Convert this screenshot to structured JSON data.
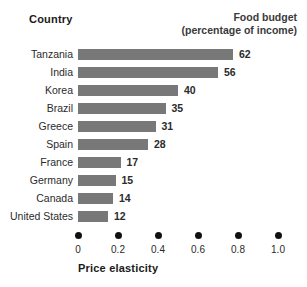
{
  "header": {
    "country_label": "Country",
    "food_budget_line1": "Food budget",
    "food_budget_line2": "(percentage of income)"
  },
  "axis": {
    "title": "Price elasticity",
    "ticks": [
      "0",
      "0.2",
      "0.4",
      "0.6",
      "0.8",
      "1.0"
    ]
  },
  "colors": {
    "bar": "#787878",
    "text": "#2b2b2b",
    "dot": "#111111",
    "background": "#ffffff"
  },
  "chart_data": {
    "type": "bar",
    "orientation": "horizontal",
    "title": "Food budget (percentage of income)",
    "xlabel": "Price elasticity",
    "ylabel": "Country",
    "categories": [
      "Tanzania",
      "India",
      "Korea",
      "Brazil",
      "Greece",
      "Spain",
      "France",
      "Germany",
      "Canada",
      "United States"
    ],
    "values": [
      62,
      56,
      40,
      35,
      31,
      28,
      17,
      15,
      14,
      12
    ],
    "value_labels": [
      "62",
      "56",
      "40",
      "35",
      "31",
      "28",
      "17",
      "15",
      "14",
      "12"
    ],
    "series": [
      {
        "name": "Food budget (percentage of income)",
        "values": [
          62,
          56,
          40,
          35,
          31,
          28,
          17,
          15,
          14,
          12
        ]
      }
    ],
    "xlim": [
      0,
      1.0
    ],
    "x_ticks": [
      0,
      0.2,
      0.4,
      0.6,
      0.8,
      1.0
    ],
    "x_tick_labels": [
      "0",
      "0.2",
      "0.4",
      "0.6",
      "0.8",
      "1.0"
    ],
    "bar_value_max": 80,
    "grid": false,
    "legend": false,
    "note": "Bar lengths encode food budget percentage of income; the bottom axis shows price elasticity from 0 to 1.0"
  }
}
